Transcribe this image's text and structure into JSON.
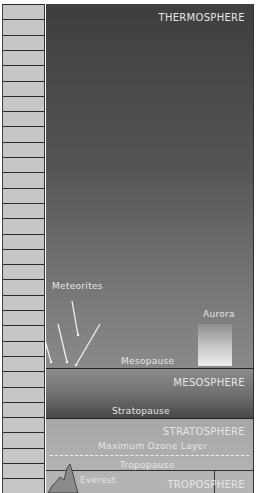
{
  "caption_cut": "Fig. Layers of the atmosphere",
  "scale": {
    "row_count": 32
  },
  "layers": {
    "thermosphere": {
      "label": "THERMOSPHERE"
    },
    "mesosphere": {
      "label": "MESOSPHERE"
    },
    "stratosphere": {
      "label": "STRATOSPHERE"
    },
    "troposphere": {
      "label": "TROPOSPHERE"
    }
  },
  "boundaries": {
    "mesopause": "Mesopause",
    "stratopause": "Stratopause",
    "tropopause": "Tropopause",
    "ozone": "Maximum Ozone Layer"
  },
  "features": {
    "meteorites": "Meteorites",
    "aurora": "Aurora",
    "everest": "Everest"
  },
  "colors": {
    "scale_fill": "#c6c6c6",
    "thermosphere_top": "#3e3e3e",
    "mesosphere_bottom": "#474747",
    "stratosphere": "#acacac",
    "troposphere": "#b4b4b4",
    "label_text": "#e6e6e6",
    "mountain": "#8a8a8a"
  }
}
